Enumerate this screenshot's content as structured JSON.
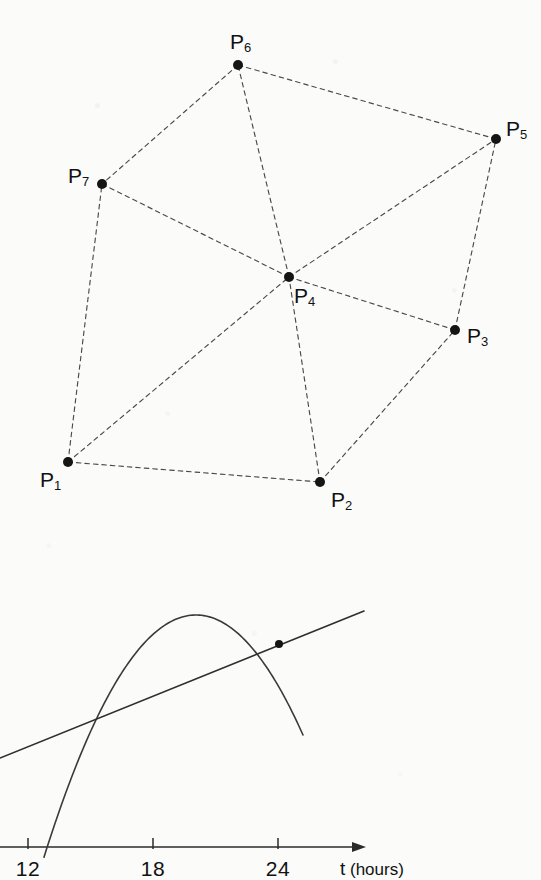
{
  "figure_top": {
    "name": "point-triangulation-diagram",
    "points": [
      {
        "id": "P1",
        "label": "P",
        "sub": "1",
        "x": 68,
        "y": 462,
        "label_x": 40,
        "label_y": 469
      },
      {
        "id": "P2",
        "label": "P",
        "sub": "2",
        "x": 320,
        "y": 482,
        "label_x": 331,
        "label_y": 489
      },
      {
        "id": "P3",
        "label": "P",
        "sub": "3",
        "x": 455,
        "y": 330,
        "label_x": 467,
        "label_y": 325
      },
      {
        "id": "P4",
        "label": "P",
        "sub": "4",
        "x": 289,
        "y": 277,
        "label_x": 294,
        "label_y": 285
      },
      {
        "id": "P5",
        "label": "P",
        "sub": "5",
        "x": 496,
        "y": 139,
        "label_x": 506,
        "label_y": 118
      },
      {
        "id": "P6",
        "label": "P",
        "sub": "6",
        "x": 238,
        "y": 65,
        "label_x": 230,
        "label_y": 31
      },
      {
        "id": "P7",
        "label": "P",
        "sub": "7",
        "x": 102,
        "y": 184,
        "label_x": 68,
        "label_y": 165
      }
    ],
    "edges": [
      [
        "P1",
        "P2"
      ],
      [
        "P1",
        "P4"
      ],
      [
        "P1",
        "P7"
      ],
      [
        "P2",
        "P3"
      ],
      [
        "P2",
        "P4"
      ],
      [
        "P3",
        "P4"
      ],
      [
        "P3",
        "P5"
      ],
      [
        "P4",
        "P5"
      ],
      [
        "P4",
        "P6"
      ],
      [
        "P4",
        "P7"
      ],
      [
        "P5",
        "P6"
      ],
      [
        "P6",
        "P7"
      ]
    ],
    "edge_style": "dashed",
    "dot_radius": 5,
    "dot_color": "#151515",
    "edge_color": "#4a4a4a"
  },
  "chart_data": {
    "type": "line",
    "title": "",
    "xlabel": "t (hours)",
    "xlabel_text": "t",
    "xlabel_unit": "(hours)",
    "ylabel": "",
    "grid": false,
    "legend": "none",
    "axis": {
      "x_start_px": 0,
      "x_end_px": 366,
      "y_px": 847,
      "arrow": true,
      "ticks": [
        {
          "value": "12",
          "x_px": 28
        },
        {
          "value": "18",
          "x_px": 153
        },
        {
          "value": "24",
          "x_px": 278
        }
      ],
      "tick_values": [
        12,
        18,
        24
      ],
      "xlim_visible": [
        10.7,
        28.6
      ]
    },
    "series": [
      {
        "name": "parabola",
        "type": "curve",
        "shape": "downward-parabola",
        "vertex": {
          "x_px": 196,
          "y_px": 615
        },
        "x_axis_crossing_px": 55,
        "start_px": {
          "x": 44,
          "y": 880
        },
        "end_px": {
          "x": 303,
          "y": 735
        },
        "color": "#3a3a3a"
      },
      {
        "name": "tangent-line",
        "type": "line",
        "start_px": {
          "x": 0,
          "y": 758
        },
        "end_px": {
          "x": 364,
          "y": 611
        },
        "color": "#2f2f2f"
      }
    ],
    "markers": [
      {
        "name": "point-on-line",
        "x_px": 279,
        "y_px": 644,
        "radius": 4,
        "color": "#141414"
      }
    ]
  }
}
